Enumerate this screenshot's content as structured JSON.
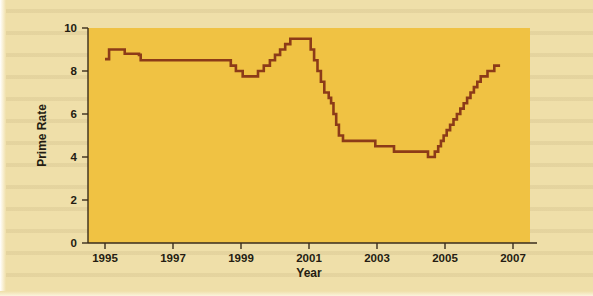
{
  "figure": {
    "plot_bg_color": "#f0c243",
    "page_bg_color": "#efdfa9",
    "line_color": "#8c3b18",
    "axis_color": "#3a2d1c",
    "text_color": "#241c12"
  },
  "chart_data": {
    "type": "line",
    "line_style": "step",
    "title": "",
    "subtitle": "",
    "xlabel": "Year",
    "ylabel": "Prime Rate",
    "xlim": [
      1994.5,
      2007.5
    ],
    "ylim": [
      0,
      10
    ],
    "xticks": [
      1995,
      1997,
      1999,
      2001,
      2003,
      2005,
      2007
    ],
    "xtick_labels": [
      "1995",
      "1997",
      "1999",
      "2001",
      "2003",
      "2005",
      "2007"
    ],
    "yticks": [
      0,
      2,
      4,
      6,
      8,
      10
    ],
    "ytick_labels": [
      "0",
      "2",
      "4",
      "6",
      "8",
      "10"
    ],
    "grid": false,
    "legend": false,
    "legend_position": "none",
    "series": [
      {
        "name": "Prime Rate",
        "color": "#8c3b18",
        "x": [
          1995.0,
          1995.1,
          1995.12,
          1995.55,
          1995.58,
          1995.95,
          1996.0,
          1996.05,
          1998.65,
          1998.7,
          1998.8,
          1998.85,
          1999.0,
          1999.05,
          1999.45,
          1999.5,
          1999.62,
          1999.67,
          1999.8,
          1999.85,
          1999.95,
          2000.0,
          2000.1,
          2000.15,
          2000.25,
          2000.3,
          2000.4,
          2000.45,
          2001.0,
          2001.05,
          2001.1,
          2001.15,
          2001.2,
          2001.25,
          2001.3,
          2001.35,
          2001.4,
          2001.45,
          2001.52,
          2001.58,
          2001.65,
          2001.72,
          2001.8,
          2001.88,
          2001.95,
          2002.0,
          2002.1,
          2002.9,
          2002.95,
          2003.45,
          2003.5,
          2004.45,
          2004.5,
          2004.62,
          2004.7,
          2004.8,
          2004.88,
          2004.96,
          2005.05,
          2005.15,
          2005.25,
          2005.35,
          2005.45,
          2005.55,
          2005.65,
          2005.75,
          2005.85,
          2005.95,
          2006.05,
          2006.15,
          2006.25,
          2006.35,
          2006.45,
          2006.55,
          2006.62
        ],
        "y": [
          8.55,
          8.55,
          9.0,
          9.0,
          8.8,
          8.8,
          8.75,
          8.5,
          8.5,
          8.25,
          8.25,
          8.0,
          8.0,
          7.75,
          7.75,
          8.0,
          8.0,
          8.25,
          8.25,
          8.5,
          8.5,
          8.75,
          8.75,
          9.0,
          9.0,
          9.25,
          9.25,
          9.5,
          9.5,
          9.0,
          9.0,
          8.5,
          8.5,
          8.0,
          8.0,
          7.5,
          7.5,
          7.0,
          7.0,
          6.75,
          6.5,
          6.0,
          5.5,
          5.0,
          5.0,
          4.75,
          4.75,
          4.75,
          4.5,
          4.5,
          4.25,
          4.25,
          4.0,
          4.0,
          4.25,
          4.5,
          4.75,
          5.0,
          5.25,
          5.5,
          5.75,
          6.0,
          6.25,
          6.5,
          6.75,
          7.0,
          7.25,
          7.5,
          7.75,
          7.75,
          8.0,
          8.0,
          8.25,
          8.25,
          8.25
        ]
      }
    ],
    "annotations": []
  }
}
